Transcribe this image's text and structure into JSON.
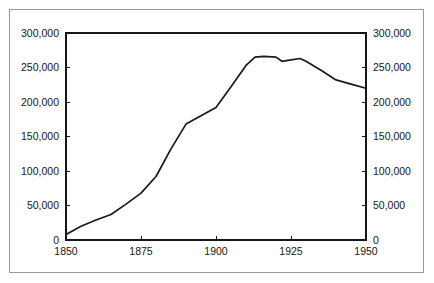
{
  "chart_data": {
    "type": "line",
    "title": "",
    "subtitle": "",
    "xlabel": "",
    "ylabel": "",
    "xlim": [
      1850,
      1950
    ],
    "ylim": [
      0,
      300000
    ],
    "grid": false,
    "legend": false,
    "legend_position": "none",
    "axes": {
      "left": {
        "tick_values": [
          0,
          50000,
          100000,
          150000,
          200000,
          250000,
          300000
        ],
        "tick_labels": [
          "0",
          "50,000",
          "100,000",
          "150,000",
          "200,000",
          "250,000",
          "300,000"
        ]
      },
      "right": {
        "tick_values": [
          0,
          50000,
          100000,
          150000,
          200000,
          250000,
          300000
        ],
        "tick_labels": [
          "0",
          "50,000",
          "100,000",
          "150,000",
          "200,000",
          "250,000",
          "300,000"
        ]
      },
      "bottom": {
        "tick_values": [
          1850,
          1875,
          1900,
          1925,
          1950
        ],
        "tick_labels": [
          "1850",
          "1875",
          "1900",
          "1925",
          "1950"
        ]
      }
    },
    "series": [
      {
        "name": "series-1",
        "color": "#1a1a1a",
        "x": [
          1850,
          1855,
          1860,
          1865,
          1870,
          1875,
          1880,
          1885,
          1890,
          1895,
          1900,
          1905,
          1910,
          1913,
          1916,
          1920,
          1922,
          1925,
          1928,
          1930,
          1935,
          1940,
          1945,
          1950
        ],
        "values": [
          8000,
          20000,
          29000,
          37000,
          52000,
          68000,
          92000,
          132000,
          168000,
          180000,
          192000,
          222000,
          253000,
          265000,
          266000,
          265000,
          259000,
          261000,
          263000,
          259000,
          246000,
          232000,
          226000,
          220000
        ]
      }
    ]
  },
  "colors": {
    "line": "#1a1a1a",
    "axis": "#161616",
    "border": "#9a9a9a",
    "background": "#ffffff"
  }
}
